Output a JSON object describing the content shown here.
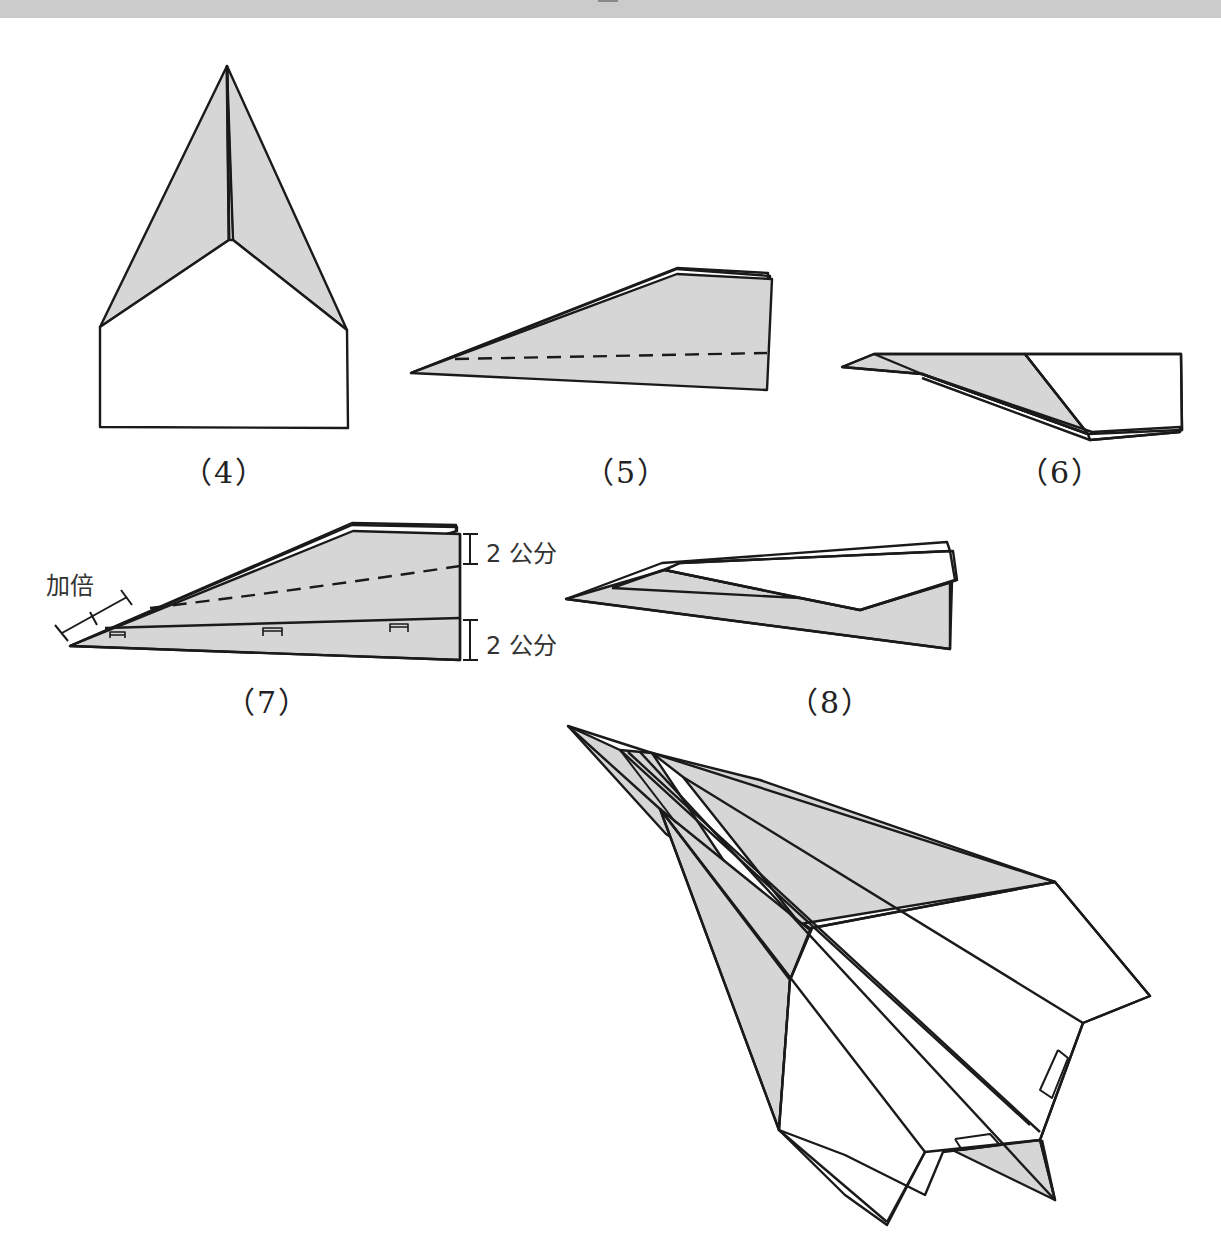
{
  "page": {
    "type": "paper airplane folding instructions",
    "fill_color": "#d6d6d6",
    "line_color": "#1a1a1a",
    "band_color": "#cbcbcb"
  },
  "steps": [
    {
      "id": "4",
      "label": "（4）"
    },
    {
      "id": "5",
      "label": "（5）"
    },
    {
      "id": "6",
      "label": "（6）"
    },
    {
      "id": "7",
      "label": "（7）",
      "annotations": {
        "double": "加倍",
        "top_measure": "2 公分",
        "bottom_measure": "2 公分"
      }
    },
    {
      "id": "8",
      "label": "（8）"
    }
  ]
}
